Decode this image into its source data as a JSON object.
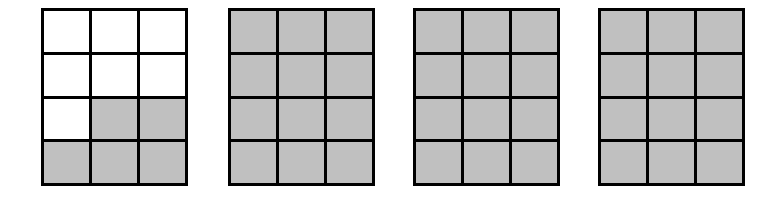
{
  "figure": {
    "canvas": {
      "width": 769,
      "height": 217,
      "background": "#ffffff"
    },
    "colors": {
      "shaded": "#c0c0c0",
      "unshaded": "#ffffff",
      "line": "#000000"
    },
    "grid_spec": {
      "columns": 3,
      "rows": 4,
      "total_cells": 12,
      "cell_border_width": 3,
      "outer_border_width": 3
    },
    "models": [
      {
        "name": "model-1",
        "label": "",
        "x": 41,
        "y": 8,
        "width": 147,
        "height": 178,
        "shaded_count": 5,
        "total_count": 12,
        "fraction": "5/12",
        "cells": [
          [
            0,
            0,
            0
          ],
          [
            0,
            0,
            0
          ],
          [
            0,
            1,
            1
          ],
          [
            1,
            1,
            1
          ]
        ]
      },
      {
        "name": "model-2",
        "label": "",
        "x": 228,
        "y": 8,
        "width": 147,
        "height": 178,
        "shaded_count": 12,
        "total_count": 12,
        "fraction": "12/12",
        "cells": [
          [
            1,
            1,
            1
          ],
          [
            1,
            1,
            1
          ],
          [
            1,
            1,
            1
          ],
          [
            1,
            1,
            1
          ]
        ]
      },
      {
        "name": "model-3",
        "label": "",
        "x": 413,
        "y": 8,
        "width": 147,
        "height": 178,
        "shaded_count": 12,
        "total_count": 12,
        "fraction": "12/12",
        "cells": [
          [
            1,
            1,
            1
          ],
          [
            1,
            1,
            1
          ],
          [
            1,
            1,
            1
          ],
          [
            1,
            1,
            1
          ]
        ]
      },
      {
        "name": "model-4",
        "label": "",
        "x": 598,
        "y": 8,
        "width": 147,
        "height": 178,
        "shaded_count": 12,
        "total_count": 12,
        "fraction": "12/12",
        "cells": [
          [
            1,
            1,
            1
          ],
          [
            1,
            1,
            1
          ],
          [
            1,
            1,
            1
          ],
          [
            1,
            1,
            1
          ]
        ]
      }
    ]
  }
}
